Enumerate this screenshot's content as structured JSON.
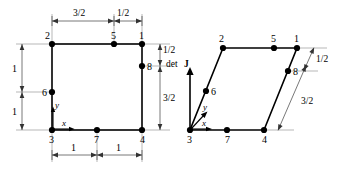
{
  "figure": {
    "background_color": "#ffffff",
    "line_color": "#000000",
    "dimension_color": "#555555",
    "extension_color": "#999999"
  },
  "left_element": {
    "name": "square-element",
    "shape": "square",
    "node_labels": {
      "n1": "1",
      "n2": "2",
      "n3": "3",
      "n4": "4",
      "n5": "5",
      "n6": "6",
      "n7": "7",
      "n8": "8"
    },
    "axes": {
      "x": "x",
      "y": "y"
    },
    "dimensions": {
      "top_left": "3/2",
      "top_right": "1/2",
      "left_upper": "1",
      "left_lower": "1",
      "right_upper": "1/2",
      "right_lower": "3/2",
      "bottom_left": "1",
      "bottom_right": "1"
    }
  },
  "right_element": {
    "name": "parallelogram-element",
    "shape": "parallelogram",
    "node_labels": {
      "n1": "1",
      "n2": "2",
      "n3": "3",
      "n4": "4",
      "n5": "5",
      "n6": "6",
      "n7": "7",
      "n8": "8"
    },
    "axes": {
      "x": "x",
      "y": "y"
    },
    "detj_label_text": "det",
    "detj_label_symbol": "J",
    "dimensions": {
      "right_upper": "1/2",
      "right_lower": "3/2"
    }
  }
}
